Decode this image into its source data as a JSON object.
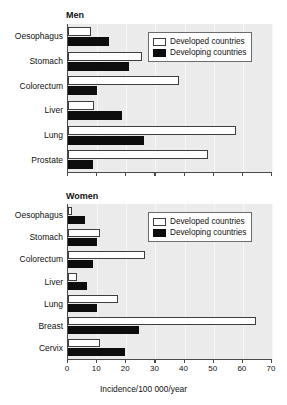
{
  "figure": {
    "xlabel": "Incidence/100 000/year",
    "legend": {
      "developed_label": "Developed countries",
      "developing_label": "Developing countries",
      "developed_color": "#ffffff",
      "developing_color": "#0d0d0d"
    },
    "xticks": [
      "0",
      "10",
      "20",
      "30",
      "40",
      "50",
      "60",
      "70"
    ]
  },
  "chart_data": [
    {
      "type": "bar",
      "title": "Men",
      "orientation": "horizontal",
      "xlabel": "Incidence/100 000/year",
      "ylabel": "",
      "xlim": [
        0,
        70
      ],
      "xticks": [
        0,
        10,
        20,
        30,
        40,
        50,
        60,
        70
      ],
      "grid": true,
      "legend_position": "top-right",
      "categories": [
        "Oesophagus",
        "Stomach",
        "Colorectum",
        "Liver",
        "Lung",
        "Prostate"
      ],
      "series": [
        {
          "name": "Developed countries",
          "color": "#ffffff",
          "values": [
            8,
            25.5,
            38,
            9,
            57.5,
            48
          ]
        },
        {
          "name": "Developing countries",
          "color": "#0d0d0d",
          "values": [
            14,
            21,
            10,
            18.5,
            26,
            8.5
          ]
        }
      ]
    },
    {
      "type": "bar",
      "title": "Women",
      "orientation": "horizontal",
      "xlabel": "Incidence/100 000/year",
      "ylabel": "",
      "xlim": [
        0,
        70
      ],
      "xticks": [
        0,
        10,
        20,
        30,
        40,
        50,
        60,
        70
      ],
      "grid": true,
      "legend_position": "top-right",
      "categories": [
        "Oesophagus",
        "Stomach",
        "Colorectum",
        "Liver",
        "Lung",
        "Breast",
        "Cervix"
      ],
      "series": [
        {
          "name": "Developed countries",
          "color": "#ffffff",
          "values": [
            1.5,
            11,
            26.5,
            3,
            17,
            64.5,
            11
          ]
        },
        {
          "name": "Developing countries",
          "color": "#0d0d0d",
          "values": [
            6,
            10,
            8.5,
            6.5,
            10,
            24.5,
            19.5
          ]
        }
      ]
    }
  ]
}
